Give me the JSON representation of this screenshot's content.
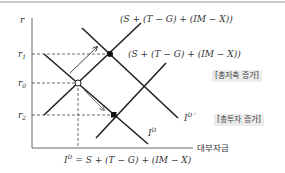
{
  "diagram": {
    "type": "loanable-funds-market",
    "axes": {
      "y_label": "r",
      "x_label": "대부자금",
      "y_ticks": [
        {
          "label": "r",
          "sub": "1",
          "y": 54
        },
        {
          "label": "r",
          "sub": "0",
          "y": 83
        },
        {
          "label": "r",
          "sub": "2",
          "y": 115
        }
      ]
    },
    "curves": {
      "savings_original_label": "(S + (T − G) + (IM − X))",
      "savings_shifted_label": "(S + (T − G) + (IM − X))",
      "investment_original_label": "I",
      "investment_original_sup": "D",
      "investment_shifted_label": "I",
      "investment_shifted_sup": "D '"
    },
    "equilibrium_points": [
      {
        "name": "E0",
        "marker": "open-circle"
      },
      {
        "name": "E1",
        "marker": "filled-circle"
      },
      {
        "name": "E2",
        "marker": "filled-square"
      }
    ],
    "annotations": {
      "savings_increase": "[총저축 증가]",
      "investment_increase": "[총투자 증가]",
      "bottom_identity_lhs": "I",
      "bottom_identity_sup": "D",
      "bottom_identity_rhs": " = S + (T − G) + (IM − X)"
    },
    "colors": {
      "line": "#222222",
      "dashed": "#444444",
      "arrow_up": "#333333",
      "arrow_down": "#888888",
      "tag_bg": "#ececec",
      "top_rule": "#b5b5b5"
    }
  }
}
